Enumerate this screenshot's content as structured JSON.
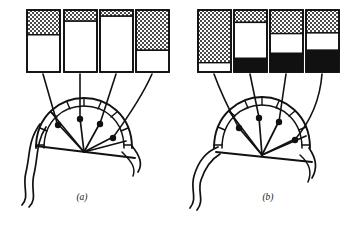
{
  "figure": {
    "title": "",
    "background_color": "#ffffff",
    "ink_color": "#111111",
    "width": 351,
    "height": 231
  },
  "legend_keys": {
    "stipple_label": "stippled",
    "white_label": "white",
    "black_label": "black"
  },
  "panels": [
    {
      "id": "a",
      "caption": "(a)",
      "caption_x": 82,
      "caption_y": 200,
      "bar_chart": {
        "type": "bar",
        "subtype": "stacked",
        "title": "",
        "xlabel": "",
        "ylabel": "",
        "ylim": [
          0,
          100
        ],
        "unit": "percent",
        "categories": [
          "1",
          "2",
          "3",
          "4"
        ],
        "series": [
          {
            "name": "stippled",
            "fill": "stipple",
            "values": [
              40,
              18,
              10,
              65
            ]
          },
          {
            "name": "white",
            "fill": "white",
            "values": [
              60,
              82,
              90,
              35
            ]
          },
          {
            "name": "black",
            "fill": "black",
            "values": [
              0,
              0,
              0,
              0
            ]
          }
        ],
        "bars": [
          {
            "index": 0,
            "x": 27,
            "y": 10,
            "w": 33,
            "h": 62,
            "stipple_pct": 40,
            "white_pct": 60,
            "black_pct": 0
          },
          {
            "index": 1,
            "x": 64,
            "y": 10,
            "w": 33,
            "h": 62,
            "stipple_pct": 18,
            "white_pct": 82,
            "black_pct": 0
          },
          {
            "index": 2,
            "x": 100,
            "y": 10,
            "w": 33,
            "h": 62,
            "stipple_pct": 10,
            "white_pct": 90,
            "black_pct": 0
          },
          {
            "index": 3,
            "x": 136,
            "y": 10,
            "w": 33,
            "h": 62,
            "stipple_pct": 65,
            "white_pct": 35,
            "black_pct": 0
          }
        ]
      },
      "fan": {
        "center_x": 84,
        "center_y": 148,
        "radius_outer": 48,
        "radius_inner": 40,
        "start_angle_deg": 182,
        "end_angle_deg": 352,
        "ray_count": 5,
        "markers": [
          {
            "index": 0,
            "x": 58,
            "y": 125
          },
          {
            "index": 1,
            "x": 80,
            "y": 119
          },
          {
            "index": 2,
            "x": 100,
            "y": 124
          },
          {
            "index": 3,
            "x": 113,
            "y": 138
          }
        ],
        "leader_lines": [
          {
            "from_x": 43,
            "from_y": 74,
            "to_x": 58,
            "to_y": 125
          },
          {
            "from_x": 80,
            "from_y": 74,
            "to_x": 80,
            "to_y": 119
          },
          {
            "from_x": 116,
            "from_y": 74,
            "to_x": 100,
            "to_y": 124
          },
          {
            "from_x": 152,
            "from_y": 74,
            "to_x": 113,
            "to_y": 138
          }
        ]
      }
    },
    {
      "id": "b",
      "caption": "(b)",
      "caption_x": 268,
      "caption_y": 200,
      "bar_chart": {
        "type": "bar",
        "subtype": "stacked",
        "title": "",
        "xlabel": "",
        "ylabel": "",
        "ylim": [
          0,
          100
        ],
        "unit": "percent",
        "categories": [
          "1",
          "2",
          "3",
          "4"
        ],
        "series": [
          {
            "name": "stippled",
            "fill": "stipple",
            "values": [
              85,
              20,
              38,
              37
            ]
          },
          {
            "name": "white",
            "fill": "white",
            "values": [
              15,
              58,
              32,
              28
            ]
          },
          {
            "name": "black",
            "fill": "black",
            "values": [
              0,
              22,
              30,
              35
            ]
          }
        ],
        "bars": [
          {
            "index": 0,
            "x": 198,
            "y": 10,
            "w": 33,
            "h": 62,
            "stipple_pct": 85,
            "white_pct": 15,
            "black_pct": 0
          },
          {
            "index": 1,
            "x": 234,
            "y": 10,
            "w": 33,
            "h": 62,
            "stipple_pct": 20,
            "white_pct": 58,
            "black_pct": 22
          },
          {
            "index": 2,
            "x": 270,
            "y": 10,
            "w": 33,
            "h": 62,
            "stipple_pct": 38,
            "white_pct": 32,
            "black_pct": 30
          },
          {
            "index": 3,
            "x": 306,
            "y": 10,
            "w": 33,
            "h": 62,
            "stipple_pct": 37,
            "white_pct": 28,
            "black_pct": 35
          }
        ]
      },
      "fan": {
        "center_x": 262,
        "center_y": 148,
        "radius_outer": 48,
        "radius_inner": 40,
        "start_angle_deg": 182,
        "end_angle_deg": 352,
        "ray_count": 5,
        "markers": [
          {
            "index": 0,
            "x": 239,
            "y": 128
          },
          {
            "index": 1,
            "x": 259,
            "y": 118
          },
          {
            "index": 2,
            "x": 279,
            "y": 122
          },
          {
            "index": 3,
            "x": 295,
            "y": 140
          }
        ],
        "leader_lines": [
          {
            "from_x": 214,
            "from_y": 74,
            "to_x": 239,
            "to_y": 128
          },
          {
            "from_x": 250,
            "from_y": 74,
            "to_x": 259,
            "to_y": 118
          },
          {
            "from_x": 286,
            "from_y": 74,
            "to_x": 279,
            "to_y": 122
          },
          {
            "from_x": 322,
            "from_y": 74,
            "to_x": 295,
            "to_y": 140
          }
        ]
      }
    }
  ]
}
